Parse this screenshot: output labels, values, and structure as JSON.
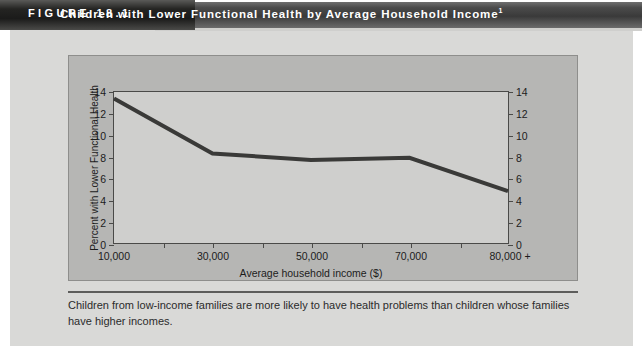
{
  "header": {
    "figure_label": "FIGURE  18.1",
    "title": "Children with Lower Functional Health by Average Household Income",
    "title_footnote_marker": "1"
  },
  "caption": {
    "text": "Children from low-income families are more likely to have health problems than children whose families have higher incomes."
  },
  "chart_data": {
    "type": "line",
    "title": "Children with Lower Functional Health by Average Household Income",
    "xlabel": "Average household income ($)",
    "ylabel": "Percent with Lower Functional Health",
    "y2label": "Percent with Lower Functional Health",
    "categories": [
      "10,000",
      "30,000",
      "50,000",
      "70,000",
      "80,000 +"
    ],
    "x_tick_labels": [
      "10,000",
      "30,000",
      "50,000",
      "70,000",
      "80,000 +"
    ],
    "y_tick_labels": [
      "0",
      "2",
      "4",
      "6",
      "8",
      "10",
      "12",
      "14"
    ],
    "y2_tick_labels": [
      "0",
      "2",
      "4",
      "6",
      "8",
      "10",
      "12",
      "14"
    ],
    "values": [
      13.4,
      8.3,
      7.7,
      7.9,
      4.8
    ],
    "ylim": [
      0,
      14
    ],
    "y2lim": [
      0,
      14
    ],
    "y_tick_step": 2,
    "grid": false,
    "legend": "none",
    "series_color": "#3a3a38",
    "plot_background": "#cfcfcd",
    "panel_background": "#b6b6b4"
  }
}
